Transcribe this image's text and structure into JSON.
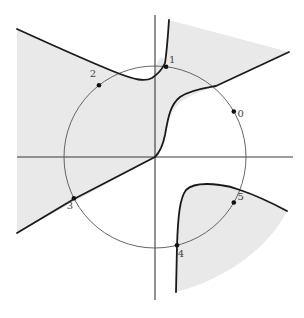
{
  "figure": {
    "colors": {
      "shade": "#e9e9e9",
      "curve": "#1a1a1a",
      "circle": "#555555",
      "axis": "#3a3a3a",
      "point": "#111111",
      "label": "#444444"
    },
    "points": [
      {
        "label": "0",
        "angle_deg": 30
      },
      {
        "label": "1",
        "angle_deg": 83
      },
      {
        "label": "2",
        "angle_deg": 128
      },
      {
        "label": "3",
        "angle_deg": 207
      },
      {
        "label": "4",
        "angle_deg": 284
      },
      {
        "label": "5",
        "angle_deg": 330
      }
    ]
  }
}
